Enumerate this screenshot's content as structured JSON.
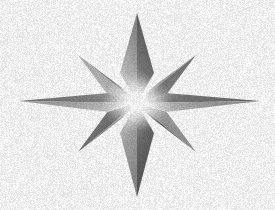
{
  "canvas": {
    "width": 275,
    "height": 210,
    "background_color": "#ffffff",
    "title": "Eight-pointed star burst"
  },
  "graphic": {
    "name": "eight-pointed-star-burst",
    "description": "Grayscale eight-pointed compass-rose style star burst with a bright white glowing core on a plain white background",
    "style": "grainy halftone shading, no outline",
    "center": {
      "x": 137,
      "y": 103
    },
    "core_highlight_color": "#ffffff",
    "core_glow_radius": 34,
    "palette": {
      "lightest": "#f2f2f2",
      "light": "#c9c9c9",
      "mid": "#9a9a9a",
      "dark": "#6e6e6e",
      "darkest": "#4a4a4a",
      "background": "#ffffff"
    },
    "point_count": 8,
    "points": [
      {
        "id": "north",
        "label": "North point",
        "angle_deg": 90,
        "tip": {
          "x": 137,
          "y": 13
        },
        "base_half_width": 16,
        "length": 90,
        "left_facet_color": "#d0d0d0",
        "right_facet_color": "#6f6f6f"
      },
      {
        "id": "northeast",
        "label": "Northeast point",
        "angle_deg": 45,
        "tip": {
          "x": 196,
          "y": 55
        },
        "base_half_width": 13,
        "length": 72,
        "left_facet_color": "#adadad",
        "right_facet_color": "#797979"
      },
      {
        "id": "east",
        "label": "East point",
        "angle_deg": 0,
        "tip": {
          "x": 260,
          "y": 101
        },
        "base_half_width": 15,
        "length": 123,
        "left_facet_color": "#868686",
        "right_facet_color": "#ababab"
      },
      {
        "id": "southeast",
        "label": "Southeast point",
        "angle_deg": -45,
        "tip": {
          "x": 196,
          "y": 152
        },
        "base_half_width": 13,
        "length": 72,
        "left_facet_color": "#5f5f5f",
        "right_facet_color": "#8c8c8c"
      },
      {
        "id": "south",
        "label": "South point",
        "angle_deg": -90,
        "tip": {
          "x": 137,
          "y": 197
        },
        "base_half_width": 16,
        "length": 94,
        "left_facet_color": "#b4b4b4",
        "right_facet_color": "#656565"
      },
      {
        "id": "southwest",
        "label": "Southwest point",
        "angle_deg": -135,
        "tip": {
          "x": 78,
          "y": 152
        },
        "base_half_width": 13,
        "length": 72,
        "left_facet_color": "#909090",
        "right_facet_color": "#6a6a6a"
      },
      {
        "id": "west",
        "label": "West point",
        "angle_deg": 180,
        "tip": {
          "x": 19,
          "y": 101
        },
        "base_half_width": 15,
        "length": 118,
        "left_facet_color": "#b0b0b0",
        "right_facet_color": "#797979"
      },
      {
        "id": "northwest",
        "label": "Northwest point",
        "angle_deg": 135,
        "tip": {
          "x": 78,
          "y": 55
        },
        "base_half_width": 13,
        "length": 72,
        "left_facet_color": "#8f8f8f",
        "right_facet_color": "#b8b8b8"
      }
    ]
  }
}
